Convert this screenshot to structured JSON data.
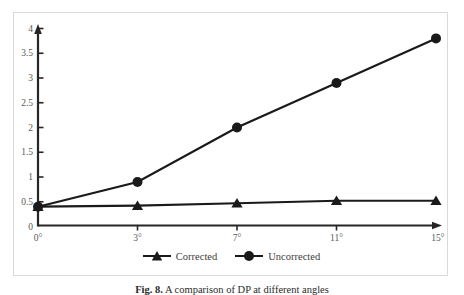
{
  "figure": {
    "caption_prefix": "Fig. 8.",
    "caption_text": " A comparison of DP at different angles"
  },
  "chart_data": {
    "type": "line",
    "categories": [
      "0°",
      "3°",
      "7°",
      "11°",
      "15°"
    ],
    "series": [
      {
        "name": "Corrected",
        "marker": "triangle",
        "values": [
          0.4,
          0.42,
          0.47,
          0.52,
          0.52
        ]
      },
      {
        "name": "Uncorrected",
        "marker": "circle",
        "values": [
          0.4,
          0.9,
          2.0,
          2.9,
          3.8
        ]
      }
    ],
    "title": "",
    "xlabel": "",
    "ylabel": "",
    "ylim": [
      0,
      4
    ],
    "ytick_step": 0.5,
    "ytick_labels": [
      "0",
      "0.5",
      "1",
      "1.5",
      "2",
      "2.5",
      "3",
      "3.5",
      "4"
    ],
    "grid": false,
    "legend_position": "bottom-center",
    "colors": {
      "line": "#1a1a1a",
      "axis": "#262626",
      "tick_label": "#595959",
      "legend_text": "#404040",
      "frame_border": "#d9d9d9",
      "background": "#ffffff"
    }
  }
}
